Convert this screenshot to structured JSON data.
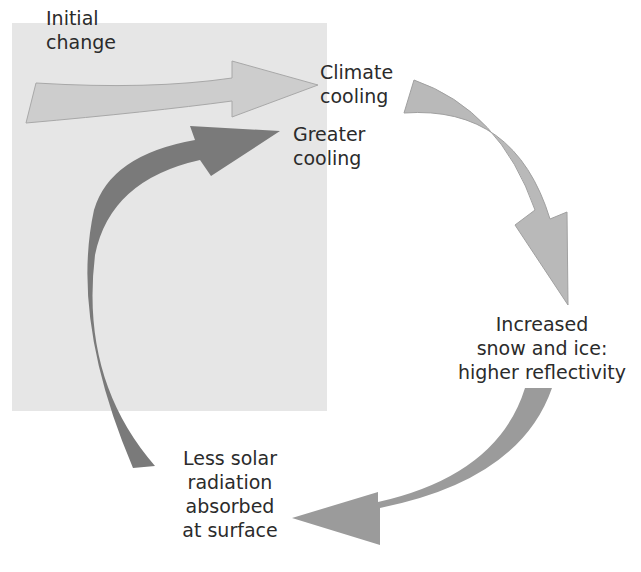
{
  "diagram": {
    "background_color": "#e6e6e6",
    "labels": {
      "initial_change": "Initial\nchange",
      "climate_cooling": "Climate\ncooling",
      "greater_cooling": "Greater\ncooling",
      "increased_snow_ice": "Increased\nsnow and ice:\nhigher reflectivity",
      "less_solar_radiation": "Less solar\nradiation\nabsorbed\nat surface"
    },
    "arrows": [
      {
        "from": "initial_change",
        "to": "climate_cooling",
        "color": "#c9c9c9"
      },
      {
        "from": "climate_cooling",
        "to": "increased_snow_ice",
        "color": "#b3b3b3"
      },
      {
        "from": "increased_snow_ice",
        "to": "less_solar_radiation",
        "color": "#9a9a9a"
      },
      {
        "from": "less_solar_radiation",
        "to": "greater_cooling",
        "color": "#777777"
      }
    ]
  }
}
